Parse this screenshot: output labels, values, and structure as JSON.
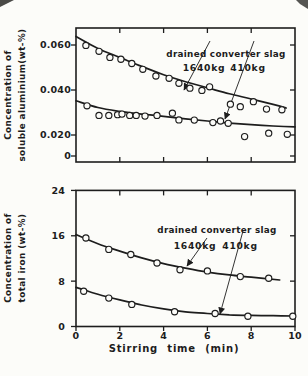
{
  "figure": {
    "background": "#fcfcf9",
    "ink": "#1d1d1d"
  },
  "chart_data": [
    {
      "id": "soluble-aluminium",
      "type": "scatter",
      "ylabel": [
        "Concentration of",
        "soluble aluminium(wt-%)"
      ],
      "xlim": [
        0,
        10
      ],
      "xticks": [
        2,
        4,
        6,
        8
      ],
      "x_tick_labels_visible": false,
      "yticks": [
        {
          "value": 0.06,
          "label": "0.060"
        },
        {
          "value": 0.04,
          "label": "0.040"
        },
        {
          "value": 0.02,
          "label": "0.020"
        },
        {
          "value": 0,
          "label": "0"
        }
      ],
      "annotation": {
        "title": "drained converter slag",
        "series_labels": [
          "1640kg",
          "410kg"
        ]
      },
      "series": [
        {
          "name": "1640kg",
          "points": [
            [
              0.45,
              0.0598
            ],
            [
              1.05,
              0.0572
            ],
            [
              1.55,
              0.0545
            ],
            [
              2.05,
              0.0537
            ],
            [
              2.55,
              0.0518
            ],
            [
              3.05,
              0.0492
            ],
            [
              3.65,
              0.0462
            ],
            [
              4.25,
              0.0452
            ],
            [
              4.7,
              0.043
            ],
            [
              5.2,
              0.0408
            ],
            [
              5.75,
              0.0398
            ],
            [
              6.1,
              0.0414
            ],
            [
              7.05,
              0.0337
            ],
            [
              7.5,
              0.0326
            ],
            [
              8.1,
              0.0348
            ],
            [
              8.7,
              0.0315
            ],
            [
              9.4,
              0.0312
            ]
          ],
          "curve": [
            [
              0,
              0.0638
            ],
            [
              1,
              0.0585
            ],
            [
              2,
              0.0545
            ],
            [
              3,
              0.0505
            ],
            [
              4,
              0.0468
            ],
            [
              5,
              0.0437
            ],
            [
              6,
              0.041
            ],
            [
              7,
              0.0383
            ],
            [
              8,
              0.036
            ],
            [
              9,
              0.0336
            ],
            [
              9.6,
              0.032
            ]
          ]
        },
        {
          "name": "410kg",
          "points": [
            [
              0.5,
              0.033
            ],
            [
              1.05,
              0.0287
            ],
            [
              1.5,
              0.0287
            ],
            [
              1.9,
              0.029
            ],
            [
              2.1,
              0.0293
            ],
            [
              2.45,
              0.0287
            ],
            [
              2.75,
              0.0287
            ],
            [
              3.15,
              0.0284
            ],
            [
              3.7,
              0.0287
            ],
            [
              4.4,
              0.0297
            ],
            [
              4.7,
              0.0267
            ],
            [
              5.4,
              0.0266
            ],
            [
              6.25,
              0.0255
            ],
            [
              6.6,
              0.0262
            ],
            [
              6.95,
              0.0252
            ],
            [
              7.7,
              0.0193
            ],
            [
              8.8,
              0.0208
            ],
            [
              9.65,
              0.0203
            ]
          ],
          "curve": [
            [
              0,
              0.0352
            ],
            [
              1,
              0.0322
            ],
            [
              2,
              0.0305
            ],
            [
              3,
              0.0293
            ],
            [
              4,
              0.0283
            ],
            [
              5,
              0.0272
            ],
            [
              6,
              0.0262
            ],
            [
              7,
              0.0253
            ],
            [
              8,
              0.0246
            ],
            [
              9,
              0.024
            ],
            [
              10,
              0.0236
            ]
          ]
        }
      ]
    },
    {
      "id": "total-iron",
      "type": "scatter",
      "xlabel": "Stirring time (min)",
      "ylabel": [
        "Concentration of",
        "total iron (wt-%)"
      ],
      "xlim": [
        0,
        10
      ],
      "xticks": [
        0,
        2,
        4,
        6,
        8,
        10
      ],
      "x_tick_labels_visible": true,
      "yticks": [
        {
          "value": 24,
          "label": "24"
        },
        {
          "value": 16,
          "label": "16"
        },
        {
          "value": 8,
          "label": "8"
        },
        {
          "value": 0,
          "label": "0"
        }
      ],
      "annotation": {
        "title": "drained converter slag",
        "series_labels": [
          "1640kg",
          "410kg"
        ]
      },
      "series": [
        {
          "name": "1640kg",
          "points": [
            [
              0.45,
              15.6
            ],
            [
              1.5,
              13.6
            ],
            [
              2.5,
              12.7
            ],
            [
              3.7,
              11.2
            ],
            [
              4.75,
              10.0
            ],
            [
              6.0,
              9.8
            ],
            [
              7.5,
              8.8
            ],
            [
              8.8,
              8.5
            ]
          ],
          "curve": [
            [
              0,
              16.2
            ],
            [
              1,
              14.6
            ],
            [
              2,
              13.3
            ],
            [
              3,
              12.1
            ],
            [
              4,
              11.1
            ],
            [
              5,
              10.3
            ],
            [
              6,
              9.6
            ],
            [
              7,
              9.1
            ],
            [
              8,
              8.7
            ],
            [
              9.3,
              8.2
            ]
          ]
        },
        {
          "name": "410kg",
          "points": [
            [
              0.35,
              6.2
            ],
            [
              1.5,
              5.0
            ],
            [
              2.55,
              3.9
            ],
            [
              4.5,
              2.6
            ],
            [
              6.35,
              2.3
            ],
            [
              7.85,
              1.8
            ],
            [
              9.9,
              1.8
            ]
          ],
          "curve": [
            [
              0,
              6.9
            ],
            [
              1,
              5.7
            ],
            [
              2,
              4.7
            ],
            [
              3,
              3.8
            ],
            [
              4,
              3.1
            ],
            [
              5,
              2.6
            ],
            [
              6,
              2.3
            ],
            [
              7,
              2.05
            ],
            [
              8,
              1.95
            ],
            [
              9,
              1.9
            ],
            [
              10,
              1.85
            ]
          ]
        }
      ]
    }
  ]
}
